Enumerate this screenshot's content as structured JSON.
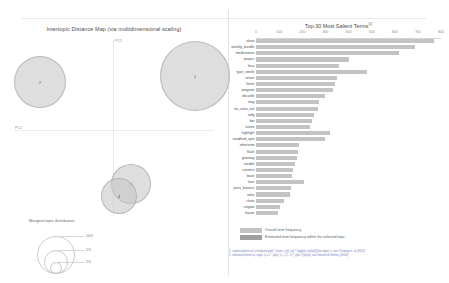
{
  "left_panel": {
    "title": "Intertopic Distance Map (via multidimensional scaling)",
    "axis_x_label": "PC1",
    "axis_y_label": "PC2",
    "topics": [
      {
        "label": "1",
        "x": 195,
        "y": 76,
        "r": 35
      },
      {
        "label": "2",
        "x": 40,
        "y": 82,
        "r": 26
      },
      {
        "label": "3",
        "x": 131,
        "y": 184,
        "r": 20
      },
      {
        "label": "4",
        "x": 119,
        "y": 196,
        "r": 18
      }
    ],
    "marginal_legend": {
      "title": "Marginal topic distribution",
      "sizes": [
        {
          "label": "2%",
          "r": 6
        },
        {
          "label": "5%",
          "r": 12
        },
        {
          "label": "10%",
          "r": 19
        }
      ]
    }
  },
  "right_panel": {
    "title": "Top-30 Most Salient Terms",
    "title_footnote_marker": "(1)",
    "legend": [
      {
        "label": "Overall term frequency",
        "color": "#c3c3c3"
      },
      {
        "label": "Estimated term frequency within the selected topic",
        "color": "#9f9f9f"
      }
    ],
    "footnote_lines": [
      "1. saliency(term w) = frequency(w) * [sum_t p(t | w) * log(p(t | w)/p(t))] for topics t; see Chuang et. al (2012)",
      "2. relevance(term w | topic t) = λ * p(w | t) + (1 - λ) * p(w | t)/p(w); see Sievert & Shirley (2014)"
    ]
  },
  "chart_data": {
    "type": "bar",
    "title": "Top-30 Most Salient Terms",
    "xlabel": "",
    "ylabel": "",
    "xlim": [
      0,
      800
    ],
    "xticks": [
      0,
      100,
      200,
      300,
      400,
      500,
      600,
      700,
      800
    ],
    "grid": false,
    "legend_position": "bottom",
    "orientation": "horizontal",
    "categories": [
      "show",
      "weekly_bundle",
      "mediconnex",
      "project",
      "face",
      "ryan_steele",
      "return",
      "finish",
      "program",
      "decurile",
      "stay",
      "tot_conn_net",
      "tuffy",
      "bot",
      "future",
      "highlight",
      "sandhed_spin",
      "ethereum",
      "flash",
      "gineway",
      "trouble",
      "connect",
      "base",
      "love",
      "price_bounce",
      "solar",
      "chain",
      "citigate",
      "house"
    ],
    "series": [
      {
        "name": "Overall term frequency",
        "values": [
          770,
          688,
          620,
          400,
          360,
          478,
          352,
          340,
          332,
          300,
          272,
          266,
          250,
          240,
          232,
          318,
          300,
          188,
          180,
          176,
          168,
          162,
          155,
          206,
          150,
          146,
          120,
          104,
          96
        ]
      },
      {
        "name": "Estimated term frequency within the selected topic",
        "values": [
          0,
          0,
          0,
          0,
          0,
          0,
          0,
          0,
          0,
          0,
          0,
          0,
          0,
          0,
          0,
          0,
          0,
          0,
          0,
          0,
          0,
          0,
          0,
          0,
          0,
          0,
          0,
          0,
          0
        ]
      }
    ]
  }
}
